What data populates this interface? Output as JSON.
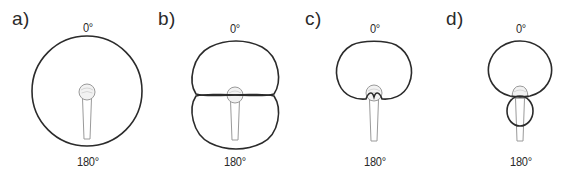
{
  "figure": {
    "panels": [
      {
        "id": "a",
        "label": "a)",
        "pattern": "omnidirectional",
        "top_angle": "0°",
        "bottom_angle": "180°"
      },
      {
        "id": "b",
        "label": "b)",
        "pattern": "figure-8 (bidirectional)",
        "top_angle": "0°",
        "bottom_angle": "180°"
      },
      {
        "id": "c",
        "label": "c)",
        "pattern": "cardioid",
        "top_angle": "0°",
        "bottom_angle": "180°"
      },
      {
        "id": "d",
        "label": "d)",
        "pattern": "supercardioid",
        "top_angle": "0°",
        "bottom_angle": "180°"
      }
    ],
    "icons": {
      "microphone": "microphone-icon"
    },
    "colors": {
      "pattern_stroke": "#2b2b2b",
      "mic_outline": "#9a9a9a",
      "text": "#2a2a2a",
      "background": "#ffffff"
    }
  }
}
